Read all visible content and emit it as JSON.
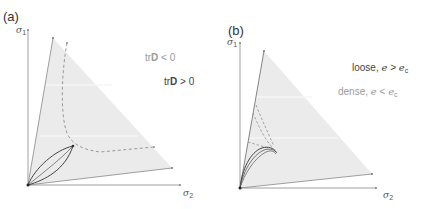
{
  "figure": {
    "panels": [
      {
        "id": "a",
        "label": "(a)",
        "axes": {
          "y_symbol": "σ",
          "y_subscript": "1",
          "x_symbol": "σ",
          "x_subscript": "2"
        },
        "annotations": [
          {
            "prefix": "tr",
            "bold": "D",
            "suffix": " < 0",
            "tone": "light"
          },
          {
            "prefix": "tr",
            "bold": "D",
            "suffix": " > 0",
            "tone": "dark"
          }
        ]
      },
      {
        "id": "b",
        "label": "(b)",
        "axes": {
          "y_symbol": "σ",
          "y_subscript": "1",
          "x_symbol": "σ",
          "x_subscript": "2"
        },
        "annotations": [
          {
            "text": "loose, ",
            "var": "e",
            "op": " > ",
            "var2": "e",
            "sub": "c",
            "tone": "dark"
          },
          {
            "text": "dense, ",
            "var": "e",
            "op": " < ",
            "var2": "e",
            "sub": "c",
            "tone": "light"
          }
        ]
      }
    ],
    "colors": {
      "triangle_fill": "#ebebeb",
      "axis": "#888888",
      "solid_curve": "#444444",
      "dashed_curve": "#999999"
    }
  }
}
